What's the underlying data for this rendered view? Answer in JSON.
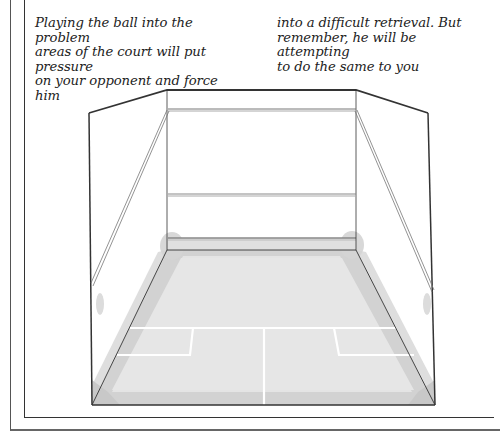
{
  "caption": {
    "column_1": "Playing the ball into the problem\nareas of the court will put pressure\non your opponent and force him",
    "column_2": "into a difficult retrieval. But\nremember, he will be attempting\nto do the same to you"
  },
  "illustration": {
    "subject": "squash court perspective diagram",
    "highlighted_areas": [
      "front-left corner",
      "front-right corner",
      "back-left corner",
      "back-right corner",
      "side wall nicks",
      "floor perimeter"
    ],
    "colors": {
      "floor": "#e4e4e4",
      "problem_area_shading": "#cfcfcf",
      "court_lines": "#ffffff",
      "outline": "#333333"
    }
  }
}
